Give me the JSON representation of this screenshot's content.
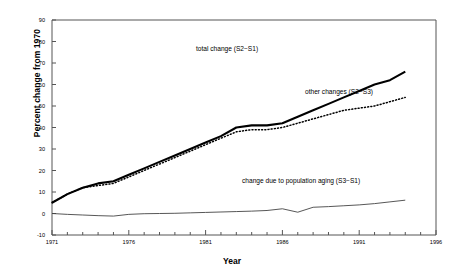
{
  "chart_data": {
    "type": "line",
    "title": "",
    "xlabel": "Year",
    "ylabel": "Percent change from 1970",
    "xlim": [
      1971,
      1996
    ],
    "ylim": [
      -10,
      90
    ],
    "ytick_step": 10,
    "xtick_step": 5,
    "minor_xticks": 1,
    "grid": false,
    "legend": "annotations-inline",
    "yticks": [
      "90",
      "80",
      "70",
      "60",
      "50",
      "40",
      "30",
      "20",
      "10",
      "0",
      "-10"
    ],
    "xticks": [
      "1971",
      "1976",
      "1981",
      "1986",
      "1991",
      "1996"
    ],
    "x": [
      1971,
      1972,
      1973,
      1974,
      1975,
      1976,
      1977,
      1978,
      1979,
      1980,
      1981,
      1982,
      1983,
      1984,
      1985,
      1986,
      1987,
      1988,
      1989,
      1990,
      1991,
      1992,
      1993,
      1994
    ],
    "series": [
      {
        "name": "total change (S2-S1)",
        "style": "solid-thick",
        "color": "#000000",
        "label": "total change (S2−S1)",
        "values": [
          5,
          9,
          12,
          14,
          15,
          18,
          21,
          24,
          27,
          30,
          33,
          36,
          40,
          41,
          41,
          42,
          45,
          48,
          51,
          54,
          57,
          60,
          62,
          66
        ]
      },
      {
        "name": "other changes (S2-S3)",
        "style": "dotted",
        "color": "#000000",
        "label": "other changes (S2−S3)",
        "values": [
          5,
          9,
          12,
          13,
          14,
          17,
          20,
          23,
          26,
          29,
          32,
          35,
          38,
          39,
          39,
          40,
          42,
          44,
          46,
          48,
          49,
          50,
          52,
          54
        ]
      },
      {
        "name": "change due to population aging (S3-S1)",
        "style": "thin",
        "color": "#333333",
        "label": "change due to population aging (S3−S1)",
        "values": [
          0,
          -0.4,
          -0.7,
          -1,
          -1.2,
          -0.4,
          -0.1,
          0,
          0.1,
          0.3,
          0.5,
          0.7,
          0.9,
          1.1,
          1.4,
          2.2,
          0.6,
          2.9,
          3.2,
          3.6,
          4,
          4.6,
          5.4,
          6.2
        ]
      }
    ],
    "annotations": [
      {
        "key": "total",
        "text": "total change (S2−S1)"
      },
      {
        "key": "other",
        "text": "other changes (S2−S3)"
      },
      {
        "key": "aging",
        "text": "change due to population aging (S3−S1)"
      }
    ]
  },
  "axis": {
    "ylabel": "Percent change from 1970",
    "xlabel": "Year"
  }
}
